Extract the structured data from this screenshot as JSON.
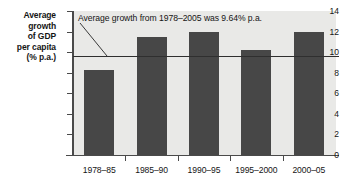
{
  "chart_data": {
    "type": "bar",
    "title": "",
    "xlabel": "",
    "ylabel": "Average growth of GDP per capita (% p.a.)",
    "ylabel_lines": [
      "Average",
      "growth",
      "of GDP",
      "per capita",
      "(% p.a.)"
    ],
    "categories": [
      "1978–85",
      "1985–90",
      "1990–95",
      "1995–2000",
      "2000–05"
    ],
    "values": [
      8.3,
      11.5,
      12.0,
      10.2,
      12.0
    ],
    "ylim": [
      0,
      14
    ],
    "yticks": [
      0,
      2,
      4,
      6,
      8,
      10,
      12,
      14
    ],
    "ytick_labels": [
      "0",
      "2",
      "4",
      "6",
      "8",
      "10",
      "12",
      "14"
    ],
    "grid": false,
    "legend": "none",
    "annotations": [
      {
        "text": "Average growth from 1978–2005 was 9.64% p.a.",
        "points_to": "average-line"
      }
    ],
    "reference_line": {
      "label": "Average growth 1978–2005",
      "value": 9.64
    },
    "colors": {
      "bar": "#474747",
      "plot_background": "#e9e9e7",
      "axis": "#4a4a4a",
      "average_line": "#2f2f2f",
      "text": "#151515",
      "page_background": "#ffffff"
    }
  }
}
